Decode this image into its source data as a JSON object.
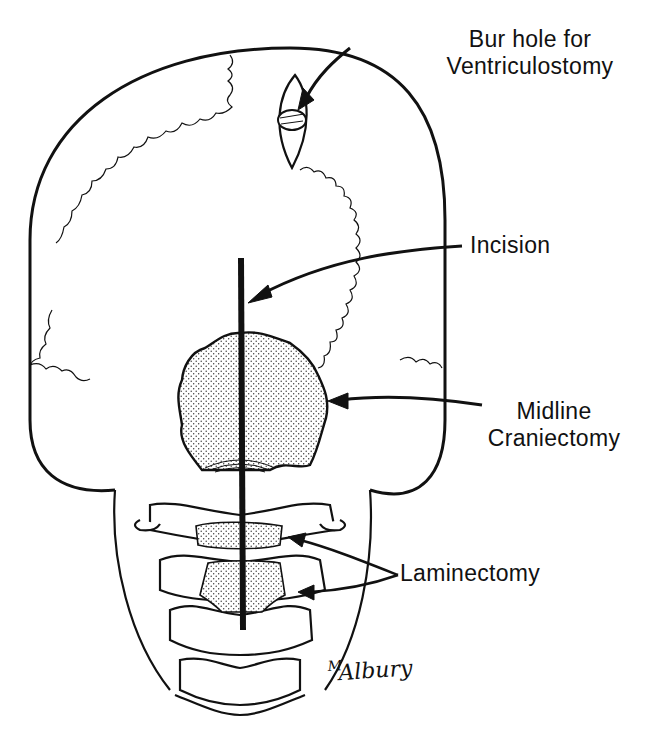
{
  "figure": {
    "colors": {
      "ink": "#111111",
      "background": "#ffffff",
      "stipple": "#e6e6e6"
    }
  },
  "labels": {
    "bur_hole": {
      "line1": "Bur hole for",
      "line2": "Ventriculostomy"
    },
    "incision": "Incision",
    "midline_craniectomy": {
      "line1": "Midline",
      "line2": "Craniectomy"
    },
    "laminectomy": "Laminectomy"
  },
  "signature": {
    "initial": "M",
    "name": "Albury"
  }
}
